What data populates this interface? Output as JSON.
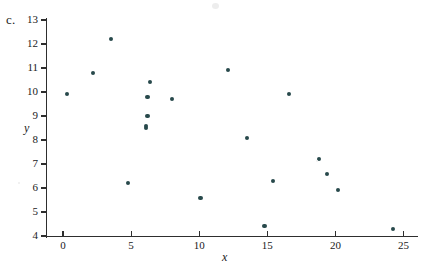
{
  "figure": {
    "part_label": "c.",
    "background": "#ffffff",
    "point_color": "#27494b",
    "axis_color": "#2e2e2e"
  },
  "chart_data": {
    "type": "scatter",
    "title": "",
    "xlabel": "x",
    "ylabel": "y",
    "xlim": [
      -0.6,
      26.2
    ],
    "ylim": [
      3.6,
      13.3
    ],
    "grid": false,
    "legend": null,
    "x_ticks": [
      0,
      5,
      10,
      15,
      20,
      25
    ],
    "x_tick_labels": [
      "0",
      "5",
      "10",
      "15",
      "20",
      "25"
    ],
    "y_ticks": [
      4,
      5,
      6,
      7,
      8,
      9,
      10,
      11,
      12,
      13
    ],
    "y_tick_labels": [
      "4",
      "5",
      "6",
      "7",
      "8",
      "9",
      "10",
      "11",
      "12",
      "13"
    ],
    "series": [
      {
        "name": "data",
        "marker": "circle",
        "color": "#27494b",
        "points": [
          [
            0.3,
            9.9
          ],
          [
            2.2,
            10.8
          ],
          [
            3.5,
            12.2
          ],
          [
            4.8,
            6.2
          ],
          [
            6.1,
            8.5
          ],
          [
            6.1,
            8.6
          ],
          [
            6.2,
            9.0
          ],
          [
            6.2,
            9.8
          ],
          [
            6.4,
            10.4
          ],
          [
            8.0,
            9.7
          ],
          [
            10.1,
            5.6
          ],
          [
            12.1,
            10.9
          ],
          [
            13.5,
            8.1
          ],
          [
            14.8,
            4.4
          ],
          [
            15.4,
            6.3
          ],
          [
            16.6,
            9.9
          ],
          [
            18.8,
            7.2
          ],
          [
            19.4,
            6.6
          ],
          [
            20.2,
            5.9
          ],
          [
            24.2,
            4.3
          ]
        ]
      }
    ]
  }
}
